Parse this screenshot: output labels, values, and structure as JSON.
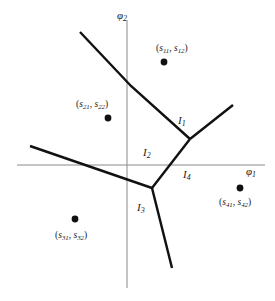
{
  "figure": {
    "background_color": "#ffffff",
    "line_color": "#111111",
    "axis_color": "#8a8a8a"
  },
  "axes": {
    "x_axis": {
      "name": "phi-1-axis",
      "label_base": "φ",
      "label_sub": "1",
      "x_start": 17,
      "x_end": 265,
      "y": 165
    },
    "y_axis": {
      "name": "phi-2-axis",
      "label_base": "φ",
      "label_sub": "2",
      "y_start": 20,
      "y_end": 288,
      "x": 127
    }
  },
  "regions": [
    {
      "id": "I1",
      "base": "I",
      "sub": "1",
      "x": 178,
      "y": 115
    },
    {
      "id": "I2",
      "base": "I",
      "sub": "2",
      "x": 143,
      "y": 147
    },
    {
      "id": "I3",
      "base": "I",
      "sub": "3",
      "x": 137,
      "y": 202
    },
    {
      "id": "I4",
      "base": "I",
      "sub": "4",
      "x": 183,
      "y": 169
    }
  ],
  "sites": [
    {
      "id": "s1",
      "label_parts": {
        "open": "(",
        "a_base": "s",
        "a_sub": "11",
        "comma": ", ",
        "b_base": "s",
        "b_sub": "12",
        "close": ")"
      },
      "dot_x": 164,
      "dot_y": 62,
      "label_x": 156,
      "label_y": 44
    },
    {
      "id": "s2",
      "label_parts": {
        "open": "(",
        "a_base": "s",
        "a_sub": "21",
        "comma": ", ",
        "b_base": "s",
        "b_sub": "22",
        "close": ")"
      },
      "dot_x": 108,
      "dot_y": 118,
      "label_x": 76,
      "label_y": 100
    },
    {
      "id": "s3",
      "label_parts": {
        "open": "(",
        "a_base": "s",
        "a_sub": "31",
        "comma": ", ",
        "b_base": "s",
        "b_sub": "32",
        "close": ")"
      },
      "dot_x": 75,
      "dot_y": 219,
      "label_x": 55,
      "label_y": 231
    },
    {
      "id": "s4",
      "label_parts": {
        "open": "(",
        "a_base": "s",
        "a_sub": "41",
        "comma": ", ",
        "b_base": "s",
        "b_sub": "42",
        "close": ")"
      },
      "dot_x": 240,
      "dot_y": 188,
      "label_x": 219,
      "label_y": 198
    }
  ],
  "boundaries": {
    "junction_upper": {
      "x": 190,
      "y": 139
    },
    "junction_lower": {
      "x": 152,
      "y": 188
    },
    "edges": [
      {
        "name": "edge-upper-left",
        "points": "80,32 131,86 190,139"
      },
      {
        "name": "edge-upper-right",
        "points": "233,105 190,139"
      },
      {
        "name": "edge-middle",
        "points": "190,139 152,188"
      },
      {
        "name": "edge-left",
        "points": "30,146 152,188"
      },
      {
        "name": "edge-lower",
        "points": "152,188 172,268"
      }
    ]
  }
}
